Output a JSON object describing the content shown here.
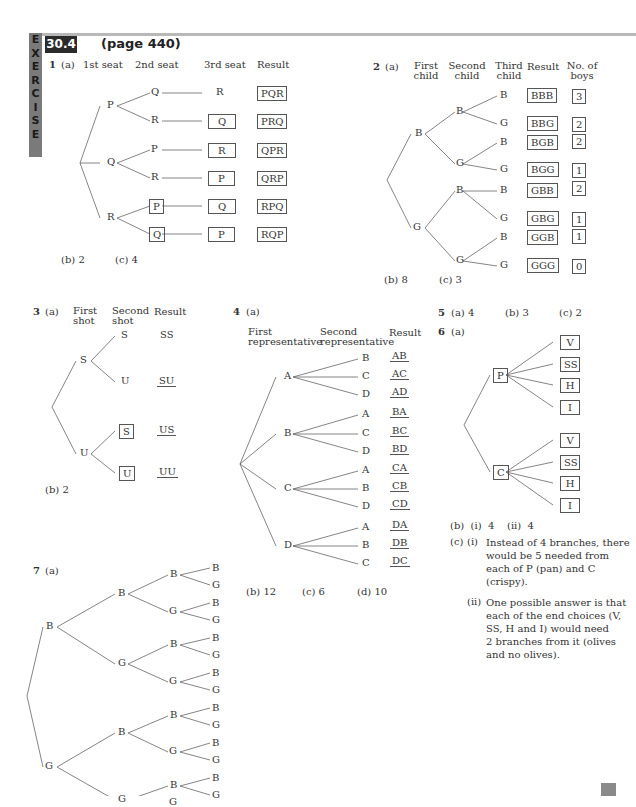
{
  "header": {
    "sidebar_letters": [
      "E",
      "X",
      "E",
      "R",
      "C",
      "I",
      "S",
      "E"
    ],
    "exercise_number": "30.4",
    "page_ref": "(page 440)"
  },
  "q1": {
    "number": "1",
    "part_a": "(a)",
    "headers": [
      "1st seat",
      "2nd seat",
      "3rd seat",
      "Result"
    ],
    "first": [
      "P",
      "Q",
      "R"
    ],
    "second": [
      "Q",
      "R",
      "P",
      "R",
      "P",
      "Q"
    ],
    "third": [
      "R",
      "Q",
      "R",
      "P",
      "Q",
      "P"
    ],
    "results": [
      "PQR",
      "PRQ",
      "QPR",
      "QRP",
      "RPQ",
      "RQP"
    ],
    "part_b": "(b)  2",
    "part_c": "(c)  4"
  },
  "q2": {
    "number": "2",
    "part_a": "(a)",
    "headers": [
      "First\nchild",
      "Second\nchild",
      "Third\nchild",
      "Result",
      "No. of\nboys"
    ],
    "first": [
      "B",
      "G"
    ],
    "second": [
      "B",
      "G",
      "B",
      "G"
    ],
    "third": [
      "B",
      "G",
      "B",
      "G",
      "B",
      "G",
      "B",
      "G"
    ],
    "results": [
      "BBB",
      "BBG",
      "BGB",
      "BGG",
      "GBB",
      "GBG",
      "GGB",
      "GGG"
    ],
    "boys": [
      "3",
      "2",
      "2",
      "1",
      "2",
      "1",
      "1",
      "0"
    ],
    "part_b": "(b)  8",
    "part_c": "(c)  3"
  },
  "q3": {
    "number": "3",
    "part_a": "(a)",
    "headers": [
      "First\nshot",
      "Second\nshot",
      "Result"
    ],
    "first": [
      "S",
      "U"
    ],
    "second": [
      "S",
      "U",
      "S",
      "U"
    ],
    "results": [
      "SS",
      "SU",
      "US",
      "UU"
    ],
    "part_b": "(b)  2"
  },
  "q4": {
    "number": "4",
    "part_a": "(a)",
    "headers": [
      "First\nrepresentative",
      "Second\nrepresentative",
      "Result"
    ],
    "first": [
      "A",
      "B",
      "C",
      "D"
    ],
    "second": [
      "B",
      "C",
      "D",
      "A",
      "C",
      "D",
      "A",
      "B",
      "D",
      "A",
      "B",
      "C"
    ],
    "results": [
      "AB",
      "AC",
      "AD",
      "BA",
      "BC",
      "BD",
      "CA",
      "CB",
      "CD",
      "DA",
      "DB",
      "DC"
    ],
    "part_b": "(b)  12",
    "part_c": "(c)  6",
    "part_d": "(d)  10"
  },
  "q5": {
    "number": "5",
    "part_a": "(a)  4",
    "part_b": "(b)  3",
    "part_c": "(c)  2"
  },
  "q6": {
    "number": "6",
    "part_a": "(a)",
    "first": [
      "P",
      "C"
    ],
    "second": [
      "V",
      "SS",
      "H",
      "I",
      "V",
      "SS",
      "H",
      "I"
    ],
    "part_b": "(b)  (i)  4    (ii)  4",
    "part_c_label": "(c)",
    "part_c_i_label": "(i)",
    "part_c_i_text": [
      "Instead of 4 branches, there",
      "would be 5 needed from",
      "each of P (pan) and C",
      "(crispy)."
    ],
    "part_c_ii_label": "(ii)",
    "part_c_ii_text": [
      "One possible answer is that",
      "each of the end choices (V,",
      "SS, H and I) would need",
      "2 branches from it (olives",
      "and no olives)."
    ]
  },
  "q7": {
    "number": "7",
    "part_a": "(a)",
    "first": [
      "B",
      "G"
    ],
    "second": [
      "B",
      "G",
      "B",
      "G"
    ],
    "third": [
      "B",
      "G",
      "B",
      "G",
      "B",
      "G",
      "B",
      "G"
    ],
    "fourth": [
      "B",
      "G",
      "B",
      "G",
      "B",
      "G",
      "B",
      "G",
      "B",
      "G",
      "B",
      "G",
      "B",
      "G",
      "B",
      "G"
    ]
  }
}
